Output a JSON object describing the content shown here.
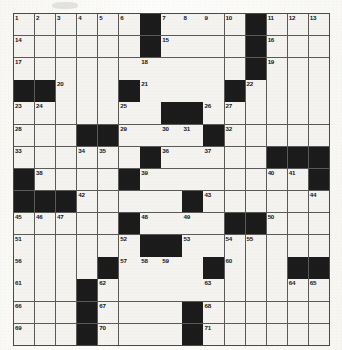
{
  "puzzle": {
    "title": "Crossword Puzzle Grid",
    "type": "crossword-grid",
    "rows": 15,
    "cols": 15,
    "cell_fill_color": "#f4f3ef",
    "block_color": "#1c1c1c",
    "line_color": "#5a5a5a",
    "background_color": "#fdfdfc",
    "highest_clue_number": 71,
    "blocks": [
      [
        0,
        6
      ],
      [
        0,
        11
      ],
      [
        1,
        6
      ],
      [
        1,
        11
      ],
      [
        2,
        11
      ],
      [
        3,
        0
      ],
      [
        3,
        1
      ],
      [
        3,
        5
      ],
      [
        3,
        10
      ],
      [
        4,
        7
      ],
      [
        4,
        8
      ],
      [
        5,
        3
      ],
      [
        5,
        4
      ],
      [
        5,
        9
      ],
      [
        6,
        6
      ],
      [
        6,
        12
      ],
      [
        6,
        13
      ],
      [
        6,
        14
      ],
      [
        7,
        0
      ],
      [
        7,
        5
      ],
      [
        7,
        14
      ],
      [
        8,
        0
      ],
      [
        8,
        1
      ],
      [
        8,
        2
      ],
      [
        8,
        8
      ],
      [
        9,
        5
      ],
      [
        9,
        10
      ],
      [
        9,
        11
      ],
      [
        10,
        6
      ],
      [
        10,
        7
      ],
      [
        11,
        4
      ],
      [
        11,
        9
      ],
      [
        11,
        13
      ],
      [
        11,
        14
      ],
      [
        12,
        3
      ],
      [
        13,
        3
      ],
      [
        13,
        8
      ],
      [
        14,
        3
      ],
      [
        14,
        8
      ]
    ],
    "numbers": [
      {
        "n": 1,
        "row": 0,
        "col": 0
      },
      {
        "n": 2,
        "row": 0,
        "col": 1
      },
      {
        "n": 3,
        "row": 0,
        "col": 2
      },
      {
        "n": 4,
        "row": 0,
        "col": 3
      },
      {
        "n": 5,
        "row": 0,
        "col": 4
      },
      {
        "n": 6,
        "row": 0,
        "col": 5
      },
      {
        "n": 7,
        "row": 0,
        "col": 7
      },
      {
        "n": 8,
        "row": 0,
        "col": 8
      },
      {
        "n": 9,
        "row": 0,
        "col": 9
      },
      {
        "n": 10,
        "row": 0,
        "col": 10
      },
      {
        "n": 11,
        "row": 0,
        "col": 12
      },
      {
        "n": 12,
        "row": 0,
        "col": 13
      },
      {
        "n": 13,
        "row": 0,
        "col": 14
      },
      {
        "n": 14,
        "row": 1,
        "col": 0
      },
      {
        "n": 15,
        "row": 1,
        "col": 7
      },
      {
        "n": 16,
        "row": 1,
        "col": 12
      },
      {
        "n": 17,
        "row": 2,
        "col": 0
      },
      {
        "n": 18,
        "row": 2,
        "col": 6
      },
      {
        "n": 19,
        "row": 2,
        "col": 12
      },
      {
        "n": 20,
        "row": 3,
        "col": 2
      },
      {
        "n": 21,
        "row": 3,
        "col": 6
      },
      {
        "n": 22,
        "row": 3,
        "col": 11
      },
      {
        "n": 23,
        "row": 4,
        "col": 0
      },
      {
        "n": 24,
        "row": 4,
        "col": 1
      },
      {
        "n": 25,
        "row": 4,
        "col": 5
      },
      {
        "n": 26,
        "row": 4,
        "col": 9
      },
      {
        "n": 27,
        "row": 4,
        "col": 10
      },
      {
        "n": 28,
        "row": 5,
        "col": 0
      },
      {
        "n": 29,
        "row": 5,
        "col": 5
      },
      {
        "n": 30,
        "row": 5,
        "col": 7
      },
      {
        "n": 31,
        "row": 5,
        "col": 8
      },
      {
        "n": 32,
        "row": 5,
        "col": 10
      },
      {
        "n": 33,
        "row": 6,
        "col": 0
      },
      {
        "n": 34,
        "row": 6,
        "col": 3
      },
      {
        "n": 35,
        "row": 6,
        "col": 4
      },
      {
        "n": 36,
        "row": 6,
        "col": 7
      },
      {
        "n": 37,
        "row": 6,
        "col": 9
      },
      {
        "n": 38,
        "row": 7,
        "col": 1
      },
      {
        "n": 39,
        "row": 7,
        "col": 6
      },
      {
        "n": 40,
        "row": 7,
        "col": 12
      },
      {
        "n": 41,
        "row": 7,
        "col": 13
      },
      {
        "n": 42,
        "row": 8,
        "col": 3
      },
      {
        "n": 43,
        "row": 8,
        "col": 9
      },
      {
        "n": 44,
        "row": 8,
        "col": 14
      },
      {
        "n": 45,
        "row": 9,
        "col": 0
      },
      {
        "n": 46,
        "row": 9,
        "col": 1
      },
      {
        "n": 47,
        "row": 9,
        "col": 2
      },
      {
        "n": 48,
        "row": 9,
        "col": 6
      },
      {
        "n": 49,
        "row": 9,
        "col": 8
      },
      {
        "n": 50,
        "row": 9,
        "col": 12
      },
      {
        "n": 51,
        "row": 10,
        "col": 0
      },
      {
        "n": 52,
        "row": 10,
        "col": 5
      },
      {
        "n": 53,
        "row": 10,
        "col": 8
      },
      {
        "n": 54,
        "row": 10,
        "col": 10
      },
      {
        "n": 55,
        "row": 10,
        "col": 11
      },
      {
        "n": 56,
        "row": 11,
        "col": 0
      },
      {
        "n": 57,
        "row": 11,
        "col": 5
      },
      {
        "n": 58,
        "row": 11,
        "col": 6
      },
      {
        "n": 59,
        "row": 11,
        "col": 7
      },
      {
        "n": 60,
        "row": 11,
        "col": 10
      },
      {
        "n": 61,
        "row": 12,
        "col": 0
      },
      {
        "n": 62,
        "row": 12,
        "col": 4
      },
      {
        "n": 63,
        "row": 12,
        "col": 9
      },
      {
        "n": 64,
        "row": 12,
        "col": 13
      },
      {
        "n": 65,
        "row": 12,
        "col": 14
      },
      {
        "n": 66,
        "row": 13,
        "col": 0
      },
      {
        "n": 67,
        "row": 13,
        "col": 4
      },
      {
        "n": 68,
        "row": 13,
        "col": 9
      },
      {
        "n": 69,
        "row": 14,
        "col": 0
      },
      {
        "n": 70,
        "row": 14,
        "col": 4
      },
      {
        "n": 71,
        "row": 14,
        "col": 9
      }
    ]
  }
}
